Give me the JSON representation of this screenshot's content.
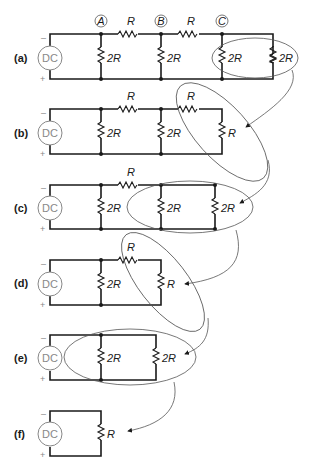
{
  "diagram": {
    "source_label": "DC",
    "polarity": {
      "top": "–",
      "bottom": "+"
    },
    "nodes": [
      "A",
      "B",
      "C"
    ],
    "panels": [
      {
        "id": "a",
        "label": "(a)",
        "resistors": [
          "R",
          "R",
          "2R",
          "2R",
          "2R",
          "2R"
        ]
      },
      {
        "id": "b",
        "label": "(b)",
        "resistors": [
          "R",
          "R",
          "2R",
          "2R",
          "R"
        ]
      },
      {
        "id": "c",
        "label": "(c)",
        "resistors": [
          "R",
          "2R",
          "2R",
          "2R"
        ]
      },
      {
        "id": "d",
        "label": "(d)",
        "resistors": [
          "R",
          "2R",
          "R"
        ]
      },
      {
        "id": "e",
        "label": "(e)",
        "resistors": [
          "2R",
          "2R"
        ]
      },
      {
        "id": "f",
        "label": "(f)",
        "resistors": [
          "R"
        ]
      }
    ]
  }
}
